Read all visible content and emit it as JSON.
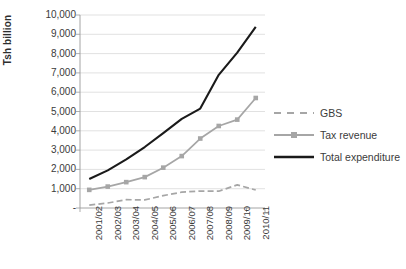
{
  "chart_data": {
    "type": "line",
    "title": "",
    "xlabel": "",
    "ylabel": "Tsh billion",
    "ylim": [
      0,
      10000
    ],
    "ytick_step": 1000,
    "grid": true,
    "legend_position": "right",
    "categories": [
      "2001/02",
      "2002/03",
      "2003/04",
      "2004/05",
      "2005/06",
      "2006/07",
      "2007/08",
      "2008/09",
      "2009/10",
      "2010/11"
    ],
    "ytick_labels": [
      "10,000",
      "9,000",
      "8,000",
      "7,000",
      "6,000",
      "5,000",
      "4,000",
      "3,000",
      "2,000",
      "1,000",
      "-"
    ],
    "ytick_values": [
      10000,
      9000,
      8000,
      7000,
      6000,
      5000,
      4000,
      3000,
      2000,
      1000,
      0
    ],
    "series": [
      {
        "name": "GBS",
        "style": "dashed",
        "color": "#a6a6a6",
        "marker": "none",
        "values": [
          150,
          260,
          430,
          420,
          640,
          820,
          880,
          870,
          1200,
          930
        ]
      },
      {
        "name": "Tax revenue",
        "style": "solid",
        "color": "#a6a6a6",
        "marker": "square",
        "values": [
          940,
          1110,
          1340,
          1600,
          2090,
          2690,
          3600,
          4250,
          4580,
          5700
        ]
      },
      {
        "name": "Total expenditure",
        "style": "solid",
        "color": "#1a1a1a",
        "marker": "none",
        "values": [
          1500,
          1950,
          2520,
          3160,
          3880,
          4620,
          5150,
          6900,
          8050,
          9380
        ]
      }
    ]
  },
  "axis": {
    "y_title": "Tsh billion",
    "axis_line_color": "#9a9a9a",
    "gridline_color": "#d4d4d4"
  },
  "legend": {
    "items": [
      {
        "label": "GBS"
      },
      {
        "label": "Tax revenue"
      },
      {
        "label": "Total expenditure"
      }
    ]
  }
}
